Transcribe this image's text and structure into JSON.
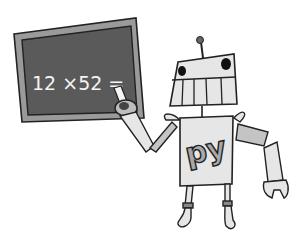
{
  "illustration": {
    "subject": "cartoon robot teaching at a chalkboard",
    "chalkboard": {
      "equation": "12 ×52 ="
    },
    "robot": {
      "chest_logo": "py"
    }
  },
  "colors": {
    "background": "#ffffff",
    "board_surface": "#5a5a5a",
    "board_frame": "#9a9a9a",
    "outline": "#222222",
    "robot_body": "#e6e6e6",
    "robot_arm": "#c4c4c4",
    "logo_fill": "#a8a8a8",
    "chalk": "#f4f4f4"
  }
}
